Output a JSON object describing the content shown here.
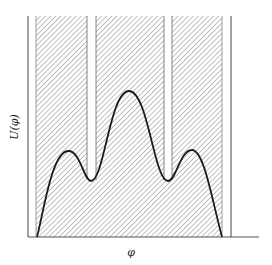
{
  "figure": {
    "ylabel": "U(φ)",
    "xlabel": "φ",
    "colors": {
      "curve": "#1a1a1a",
      "hatch": "#8a8a8a",
      "frame": "#555555",
      "background": "#ffffff"
    },
    "frame": {
      "left_x": 28,
      "right_x": 231,
      "top_y": 16,
      "baseline_y": 237,
      "baseline_end_x": 259
    },
    "hatched_region": {
      "x_start": 36,
      "x_end": 222
    },
    "white_gaps": [
      {
        "x_start": 87,
        "x_end": 96
      },
      {
        "x_start": 164,
        "x_end": 172
      }
    ],
    "curve_points": [
      {
        "label": "left-end",
        "x": 37,
        "y": 237
      },
      {
        "label": "left-peak",
        "x": 68,
        "y": 151
      },
      {
        "label": "left-min",
        "x": 91,
        "y": 181
      },
      {
        "label": "center-peak",
        "x": 129,
        "y": 91
      },
      {
        "label": "right-min",
        "x": 168,
        "y": 181
      },
      {
        "label": "right-peak",
        "x": 192,
        "y": 150
      },
      {
        "label": "right-end",
        "x": 222,
        "y": 237
      }
    ]
  }
}
